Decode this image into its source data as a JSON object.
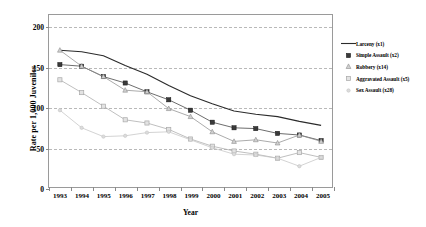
{
  "chart_data": {
    "type": "line",
    "title": "",
    "xlabel": "Year",
    "ylabel": "Rate per 1,000 Juveniles",
    "categories": [
      1993,
      1994,
      1995,
      1996,
      1997,
      1998,
      1999,
      2000,
      2001,
      2002,
      2003,
      2004,
      2005
    ],
    "xtick_labels": [
      "1993",
      "1994",
      "1995",
      "1996",
      "1997",
      "1998",
      "1999",
      "2000",
      "2001",
      "2002",
      "2003",
      "2004",
      "2005"
    ],
    "ytick_labels": [
      "0",
      "50",
      "100",
      "150",
      "200"
    ],
    "yticks": [
      0,
      50,
      100,
      150,
      200
    ],
    "ylim": [
      0,
      215
    ],
    "grid": "horizontal-dashed",
    "legend_position": "right",
    "series": [
      {
        "name": "Larceny (x1)",
        "label": "Larceny (x1)",
        "marker": "none",
        "color": "#2b2b2b",
        "values": [
          171,
          169,
          164,
          152,
          141,
          127,
          114,
          104,
          95,
          91,
          88,
          82,
          77
        ]
      },
      {
        "name": "Simple Assault (x2)",
        "label": "Simple Assault (x2)",
        "marker": "square-filled",
        "color": "#3a3a3a",
        "values": [
          153,
          151,
          138,
          130,
          119,
          109,
          96,
          81,
          74,
          73,
          67,
          65,
          58
        ]
      },
      {
        "name": "Robbery (x14)",
        "label": "Robbery (x14)",
        "marker": "triangle",
        "color": "#8d8d8d",
        "values": [
          171,
          151,
          138,
          121,
          119,
          98,
          88,
          69,
          57,
          59,
          55,
          65,
          57
        ]
      },
      {
        "name": "Aggravated Assault (x5)",
        "label": "Aggravated Assault (x5)",
        "marker": "square-open",
        "color": "#a8a8a8",
        "values": [
          134,
          118,
          101,
          84,
          80,
          72,
          60,
          51,
          45,
          41,
          36,
          43,
          37
        ]
      },
      {
        "name": "Sex Assault (x28)",
        "label": "Sex Assault (x28)",
        "marker": "dot",
        "color": "#c4c4c4",
        "values": [
          96,
          74,
          63,
          64,
          68,
          69,
          59,
          49,
          41,
          40,
          36,
          26,
          37
        ]
      }
    ]
  },
  "axis": {
    "y_title": "Rate per 1,000 Juveniles",
    "x_title": "Year"
  }
}
